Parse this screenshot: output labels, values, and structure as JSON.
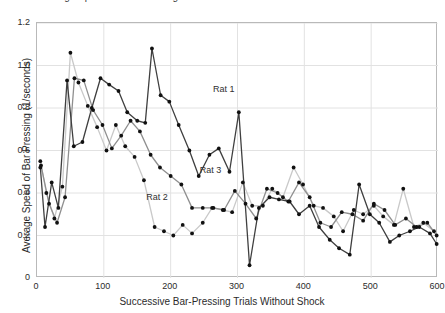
{
  "title": "Average Speed of Bar Pressing on Successive Trials Without Shock for Three Rats",
  "axis": {
    "y_label": "Average Speed of Bar Pressing (1/seconds)",
    "x_label": "Successive Bar-Pressing Trials Without Shock",
    "y_ticks": [
      "0",
      "0.2",
      "0.4",
      "0.6",
      "0.8",
      "1.0",
      "1.2"
    ],
    "x_ticks": [
      "0",
      "100",
      "200",
      "300",
      "400",
      "500",
      "600"
    ]
  },
  "annotations": [
    {
      "text": "Rat 1",
      "x": 265,
      "y": 0.88
    },
    {
      "text": "Rat 3",
      "x": 245,
      "y": 0.5
    },
    {
      "text": "Rat 2",
      "x": 165,
      "y": 0.37
    }
  ],
  "colors": {
    "rat1": "#3f3f3f",
    "rat2": "#c9c9c9",
    "rat3": "#8f8f8f",
    "grid": "#e2e2e2",
    "frame": "#b9b9b9",
    "marker": "#111111",
    "text": "#2b2b2b"
  },
  "chart_data": {
    "type": "line",
    "title": "Average Speed of Bar Pressing on Successive Trials Without Shock for Three Rats",
    "xlabel": "Successive Bar-Pressing Trials Without Shock",
    "ylabel": "Average Speed of Bar Pressing (1/seconds)",
    "xlim": [
      0,
      600
    ],
    "ylim": [
      0,
      1.2
    ],
    "yticks": [
      0,
      0.2,
      0.4,
      0.6,
      0.8,
      1.0,
      1.2
    ],
    "xticks": [
      0,
      100,
      200,
      300,
      400,
      500,
      600
    ],
    "grid": true,
    "legend": "inline-annotations",
    "series": [
      {
        "name": "Rat 1",
        "color": "#3f3f3f",
        "x": [
          5,
          12,
          22,
          32,
          45,
          55,
          68,
          82,
          95,
          108,
          122,
          135,
          150,
          162,
          172,
          185,
          198,
          212,
          228,
          242,
          258,
          272,
          288,
          302,
          318,
          332,
          348,
          362,
          378,
          392,
          408,
          422,
          438,
          452,
          468,
          482,
          498,
          512,
          528,
          542,
          558,
          572,
          588,
          598
        ],
        "y": [
          0.52,
          0.24,
          0.45,
          0.33,
          0.93,
          0.62,
          0.64,
          0.8,
          0.94,
          0.91,
          0.88,
          0.78,
          0.74,
          0.73,
          1.08,
          0.86,
          0.83,
          0.72,
          0.6,
          0.48,
          0.58,
          0.61,
          0.5,
          0.78,
          0.06,
          0.33,
          0.38,
          0.37,
          0.36,
          0.3,
          0.34,
          0.24,
          0.18,
          0.14,
          0.11,
          0.44,
          0.3,
          0.26,
          0.17,
          0.2,
          0.22,
          0.24,
          0.21,
          0.16
        ]
      },
      {
        "name": "Rat 2",
        "color": "#c9c9c9",
        "x": [
          5,
          14,
          26,
          38,
          50,
          62,
          76,
          90,
          104,
          118,
          132,
          146,
          160,
          176,
          190,
          204,
          218,
          232,
          248,
          262,
          278,
          292,
          308,
          322,
          338,
          352,
          368,
          384,
          398,
          414,
          428,
          444,
          458,
          474,
          488,
          504,
          518,
          534,
          548,
          564,
          578,
          594
        ],
        "y": [
          0.55,
          0.4,
          0.28,
          0.43,
          1.06,
          0.92,
          0.81,
          0.71,
          0.6,
          0.72,
          0.62,
          0.57,
          0.46,
          0.24,
          0.22,
          0.2,
          0.25,
          0.21,
          0.26,
          0.33,
          0.32,
          0.31,
          0.45,
          0.34,
          0.34,
          0.42,
          0.38,
          0.52,
          0.44,
          0.34,
          0.33,
          0.29,
          0.22,
          0.32,
          0.3,
          0.34,
          0.29,
          0.25,
          0.42,
          0.24,
          0.26,
          0.22
        ]
      },
      {
        "name": "Rat 3",
        "color": "#8f8f8f",
        "x": [
          6,
          18,
          30,
          42,
          56,
          70,
          84,
          98,
          112,
          126,
          140,
          154,
          170,
          184,
          200,
          216,
          232,
          248,
          264,
          280,
          296,
          312,
          328,
          344,
          360,
          376,
          392,
          408,
          424,
          440,
          456,
          472,
          488,
          504,
          520,
          536,
          552,
          568,
          584,
          598
        ],
        "y": [
          0.53,
          0.35,
          0.26,
          0.38,
          0.94,
          0.93,
          0.79,
          0.72,
          0.61,
          0.67,
          0.74,
          0.69,
          0.58,
          0.52,
          0.48,
          0.44,
          0.33,
          0.33,
          0.33,
          0.32,
          0.41,
          0.35,
          0.28,
          0.42,
          0.4,
          0.36,
          0.45,
          0.38,
          0.26,
          0.24,
          0.31,
          0.3,
          0.27,
          0.35,
          0.32,
          0.25,
          0.28,
          0.24,
          0.26,
          0.2
        ]
      }
    ]
  }
}
